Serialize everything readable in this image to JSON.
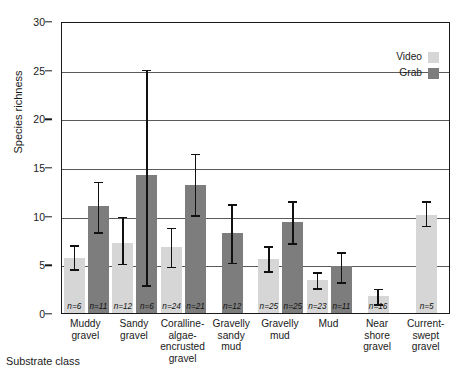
{
  "chart_data": {
    "type": "bar",
    "title": "",
    "xlabel": "Substrate class",
    "ylabel": "Species richness",
    "ylim": [
      0,
      30
    ],
    "yticks": [
      0,
      5,
      10,
      15,
      20,
      25,
      30
    ],
    "grid": true,
    "legend_position": "top-right",
    "categories": [
      "Muddy gravel",
      "Sandy gravel",
      "Coralline-algae-encrusted gravel",
      "Gravelly sandy mud",
      "Gravelly mud",
      "Mud",
      "Near shore gravel",
      "Current-swept gravel"
    ],
    "category_lines": [
      [
        "Muddy",
        "gravel"
      ],
      [
        "Sandy",
        "gravel"
      ],
      [
        "Coralline-",
        "algae-",
        "encrusted",
        "gravel"
      ],
      [
        "Gravelly",
        "sandy",
        "mud"
      ],
      [
        "Gravelly",
        "mud"
      ],
      [
        "Mud"
      ],
      [
        "Near",
        "shore",
        "gravel"
      ],
      [
        "Current-",
        "swept",
        "gravel"
      ]
    ],
    "series": [
      {
        "name": "Video",
        "color": "#d6d6d6",
        "values": [
          5.7,
          7.2,
          6.8,
          null,
          5.6,
          3.4,
          1.7,
          10.1
        ],
        "err_low": [
          4.6,
          5.2,
          4.9,
          null,
          4.4,
          2.7,
          1.0,
          9.1
        ],
        "err_high": [
          7.1,
          10.0,
          8.9,
          null,
          7.0,
          4.3,
          2.6,
          11.6
        ],
        "n": [
          6,
          12,
          24,
          null,
          25,
          23,
          16,
          5
        ]
      },
      {
        "name": "Grab",
        "color": "#7d7d7d",
        "values": [
          11.0,
          14.2,
          13.2,
          8.2,
          9.4,
          4.8,
          null,
          null
        ],
        "err_low": [
          8.4,
          3.0,
          10.2,
          5.3,
          7.3,
          3.3,
          null,
          null
        ],
        "err_high": [
          13.6,
          25.1,
          16.5,
          11.3,
          11.6,
          6.4,
          null,
          null
        ],
        "n": [
          11,
          6,
          21,
          12,
          25,
          11,
          null,
          null
        ]
      }
    ]
  },
  "legend": {
    "items": [
      {
        "label": "Video",
        "swatch": "video"
      },
      {
        "label": "Grab",
        "swatch": "grab"
      }
    ]
  },
  "axes": {
    "y_label": "Species richness",
    "x_label": "Substrate class",
    "y_tick_labels": [
      "0",
      "5",
      "10",
      "15",
      "20",
      "25",
      "30"
    ]
  }
}
